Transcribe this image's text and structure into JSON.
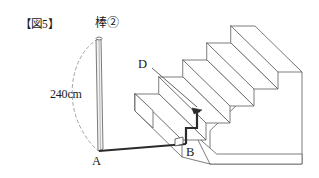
{
  "figure": {
    "title": "【図5】",
    "rod_label": "棒②",
    "length_label": "240cm",
    "point_a": "A",
    "point_b": "B",
    "point_d": "D",
    "colors": {
      "outline": "#5a5a5a",
      "path_stroke": "#2b2b2b",
      "rod_fill": "#f2f2f2",
      "face_fill": "#ffffff",
      "dash_arc": "#8c8c8c",
      "text": "#1a1a1a",
      "background": "#ffffff"
    },
    "geometry": {
      "rod_top": [
        98,
        38
      ],
      "rod_bottom": [
        99,
        151
      ],
      "point_b": [
        186,
        144
      ],
      "point_d": [
        196,
        100
      ],
      "step_count": 5
    },
    "icons": {
      "right_angle_marker": "right-angle-icon",
      "arrow_head": "arrowhead-icon"
    }
  }
}
